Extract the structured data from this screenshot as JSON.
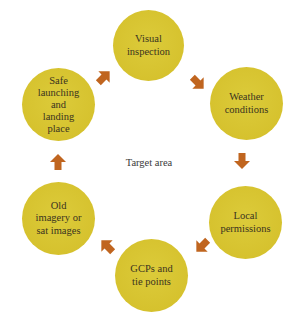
{
  "diagram": {
    "type": "cycle",
    "center_label": "Target area",
    "colors": {
      "node_fill": "#d6c22e",
      "arrow_fill": "#c0651f",
      "text": "#3a3320",
      "background": "#ffffff"
    },
    "nodes": [
      {
        "id": "visual",
        "label": "Visual\ninspection"
      },
      {
        "id": "weather",
        "label": "Weather\nconditions"
      },
      {
        "id": "local",
        "label": "Local\npermissions"
      },
      {
        "id": "gcps",
        "label": "GCPs and\ntie points"
      },
      {
        "id": "old",
        "label": "Old\nimagery or\nsat images"
      },
      {
        "id": "safe",
        "label": "Safe\nlaunching\nand\nlanding\nplace"
      }
    ],
    "arrows": [
      {
        "from": "safe",
        "to": "visual",
        "icon": "arrow-up-right-icon"
      },
      {
        "from": "visual",
        "to": "weather",
        "icon": "arrow-down-right-icon"
      },
      {
        "from": "weather",
        "to": "local",
        "icon": "arrow-down-icon"
      },
      {
        "from": "local",
        "to": "gcps",
        "icon": "arrow-down-left-icon"
      },
      {
        "from": "gcps",
        "to": "old",
        "icon": "arrow-up-left-icon"
      },
      {
        "from": "old",
        "to": "safe",
        "icon": "arrow-up-icon"
      }
    ]
  }
}
